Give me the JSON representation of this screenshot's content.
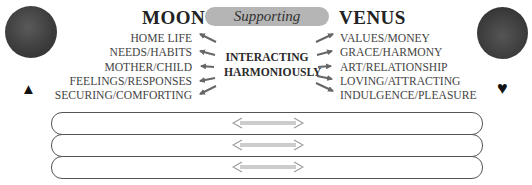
{
  "left": {
    "title": "MOON",
    "symbol": "▲",
    "symbol_name": "triangle-icon",
    "items": [
      "HOME LIFE",
      "NEEDS/HABITS",
      "MOTHER/CHILD",
      "FEELINGS/RESPONSES",
      "SECURING/COMFORTING"
    ]
  },
  "center": {
    "relationship": "Supporting",
    "label_line1": "INTERACTING",
    "label_line2": "HARMONIOUSLY"
  },
  "right": {
    "title": "VENUS",
    "symbol": "♥",
    "symbol_name": "heart-icon",
    "items": [
      "VALUES/MONEY",
      "GRACE/HARMONY",
      "ART/RELATIONSHIP",
      "LOVING/ATTRACTING",
      "INDULGENCE/PLEASURE"
    ]
  },
  "rows": [
    {
      "left": "",
      "right": ""
    },
    {
      "left": "",
      "right": ""
    },
    {
      "left": "",
      "right": ""
    }
  ],
  "colors": {
    "pill": "#b5b5b5",
    "text": "#444444",
    "planet": "#3e3e3e"
  }
}
